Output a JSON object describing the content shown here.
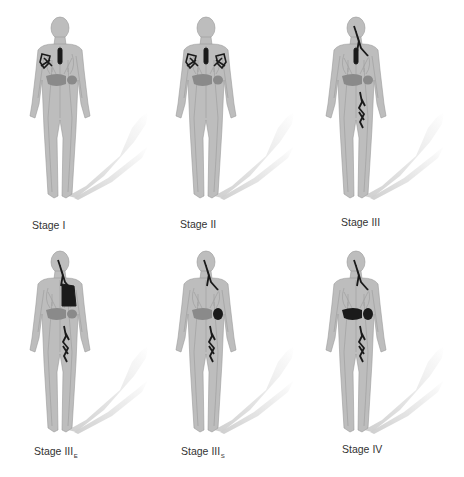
{
  "figure": {
    "colors": {
      "body": "#bdbdbd",
      "body_outline": "#9a9a9a",
      "organ": "#8a8a8a",
      "involved": "#1a1a1a",
      "shadow": "#c8c8c8",
      "label_text": "#333333"
    },
    "panels": [
      {
        "id": "stage-1",
        "label": "Stage",
        "numeral": "I",
        "subscript": "",
        "involvement": [
          "right-axillary-nodes",
          "mediastinal-node"
        ]
      },
      {
        "id": "stage-2",
        "label": "Stage",
        "numeral": "II",
        "subscript": "",
        "involvement": [
          "bilateral-axillary-nodes",
          "mediastinal-node"
        ]
      },
      {
        "id": "stage-3",
        "label": "Stage",
        "numeral": "III",
        "subscript": "",
        "involvement": [
          "cervical-nodes",
          "mediastinal-node",
          "left-inguinal-nodes"
        ]
      },
      {
        "id": "stage-3e",
        "label": "Stage",
        "numeral": "III",
        "subscript": "E",
        "involvement": [
          "cervical-nodes",
          "left-lung-extranodal",
          "left-inguinal-nodes"
        ]
      },
      {
        "id": "stage-3s",
        "label": "Stage",
        "numeral": "III",
        "subscript": "S",
        "involvement": [
          "cervical-nodes",
          "spleen",
          "left-inguinal-nodes"
        ]
      },
      {
        "id": "stage-4",
        "label": "Stage",
        "numeral": "IV",
        "subscript": "",
        "involvement": [
          "cervical-nodes",
          "liver",
          "spleen",
          "left-inguinal-nodes"
        ]
      }
    ]
  }
}
